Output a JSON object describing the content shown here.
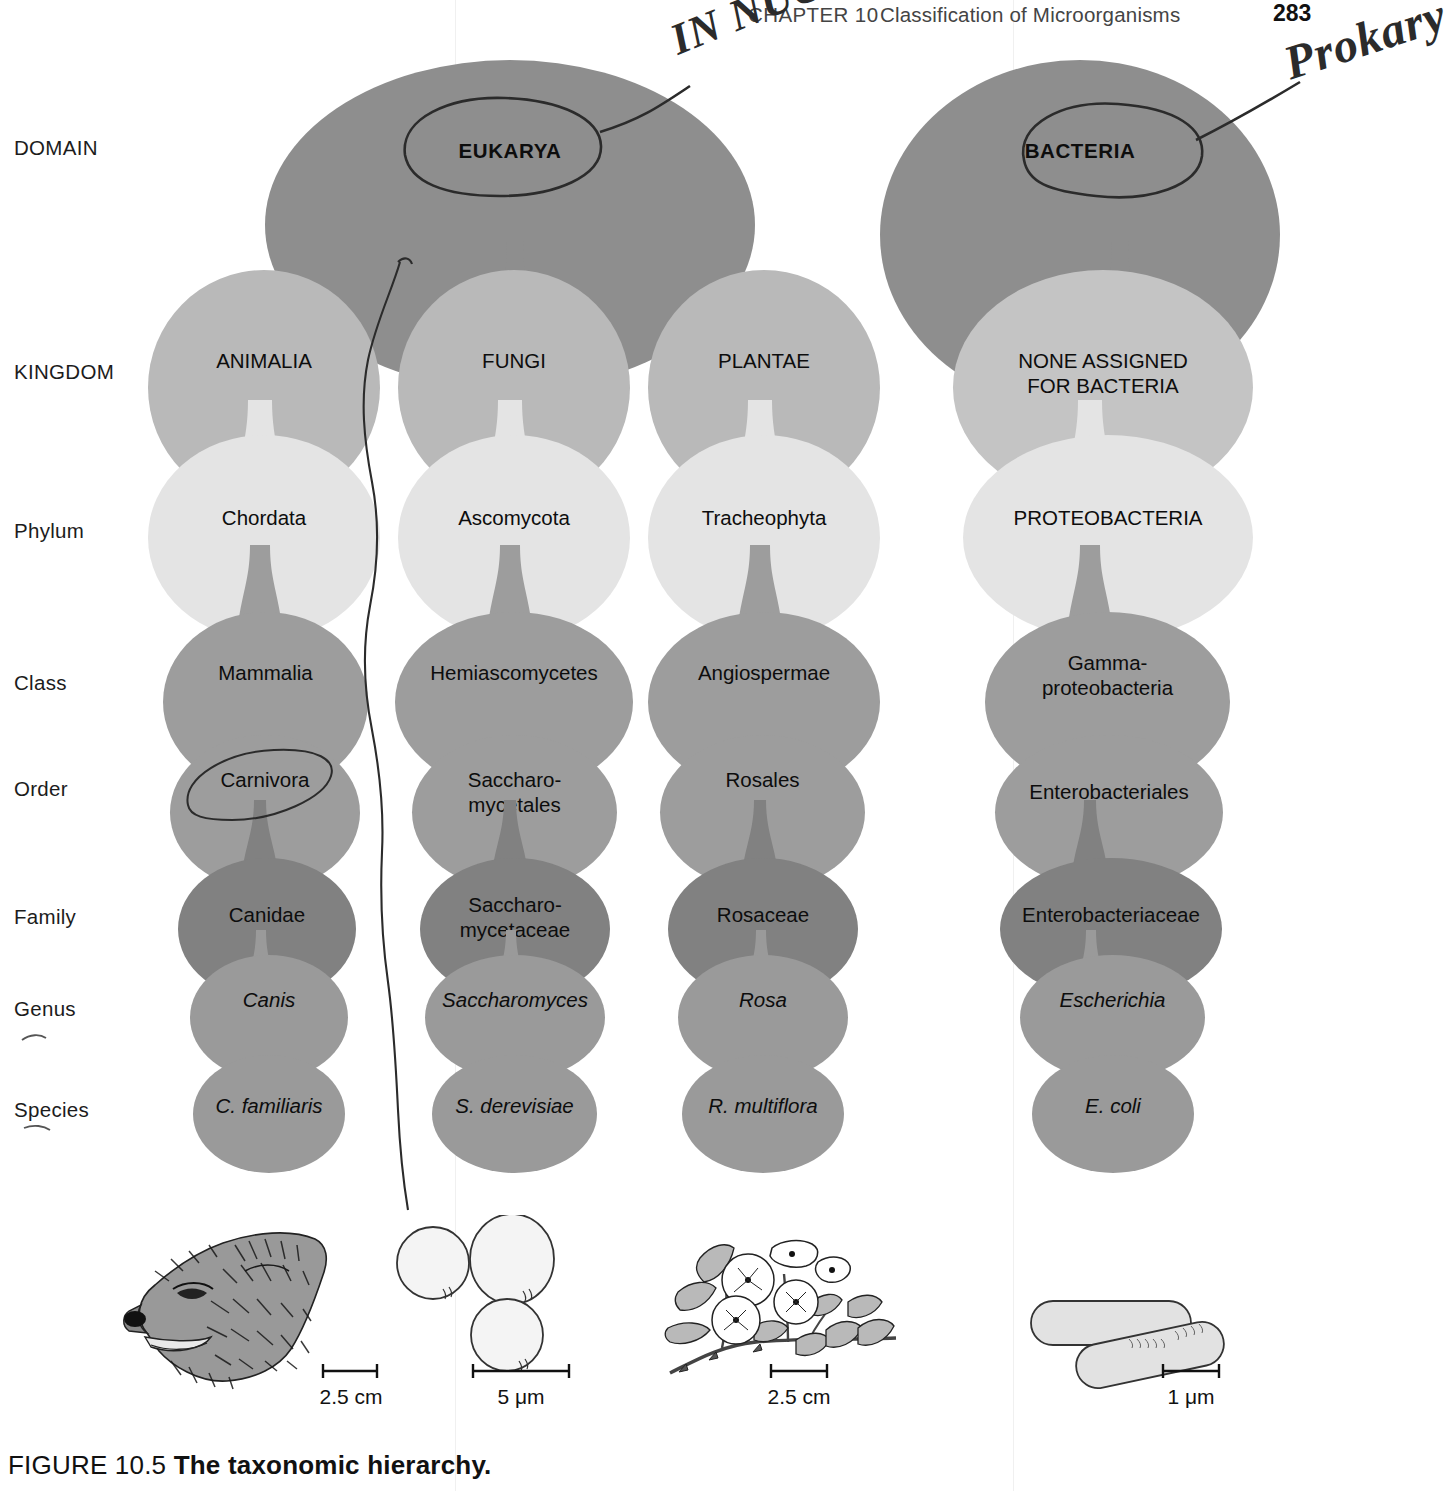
{
  "running_head": {
    "chapter": "CHAPTER 10",
    "title": "Classification of Microorganisms",
    "page_number": "283"
  },
  "ranks": [
    {
      "label": "DOMAIN",
      "y": 136
    },
    {
      "label": "KINGDOM",
      "y": 360
    },
    {
      "label": "Phylum",
      "y": 519
    },
    {
      "label": "Class",
      "y": 671
    },
    {
      "label": "Order",
      "y": 777
    },
    {
      "label": "Family",
      "y": 905
    },
    {
      "label": "Genus",
      "y": 997
    },
    {
      "label": "Species",
      "y": 1098
    }
  ],
  "columns": [
    {
      "name": "animalia-column",
      "domain": "EUKARYA",
      "kingdom": "ANIMALIA",
      "phylum": "Chordata",
      "class": "Mammalia",
      "order": "Carnivora",
      "family": "Canidae",
      "genus": "Canis",
      "species": "C. familiaris"
    },
    {
      "name": "fungi-column",
      "domain": "EUKARYA",
      "kingdom": "FUNGI",
      "phylum": "Ascomycota",
      "class": "Hemiascomycetes",
      "order": "Saccharo-\nmycetales",
      "family": "Saccharo-\nmycetaceae",
      "genus": "Saccharomyces",
      "species": "S. derevisiae"
    },
    {
      "name": "plantae-column",
      "domain": "EUKARYA",
      "kingdom": "PLANTAE",
      "phylum": "Tracheophyta",
      "class": "Angiospermae",
      "order": "Rosales",
      "family": "Rosaceae",
      "genus": "Rosa",
      "species": "R. multiflora"
    },
    {
      "name": "bacteria-column",
      "domain": "BACTERIA",
      "kingdom": "NONE ASSIGNED\nFOR BACTERIA",
      "phylum": "PROTEOBACTERIA",
      "class": "Gamma-\nproteobacteria",
      "order": "Enterobacteriales",
      "family": "Enterobacteriaceae",
      "genus": "Escherichia",
      "species": "E. coli"
    }
  ],
  "annotations": {
    "in_nucleus": "IN NUCLEUS",
    "prokaryote": "Prokary"
  },
  "organisms": [
    {
      "name": "dog-illustration",
      "scale": "2.5 cm"
    },
    {
      "name": "yeast-illustration",
      "scale": "5 μm"
    },
    {
      "name": "rose-illustration",
      "scale": "2.5 cm"
    },
    {
      "name": "ecoli-illustration",
      "scale": "1 μm"
    }
  ],
  "scale_bars": [
    {
      "value": "2.5",
      "unit": "cm"
    },
    {
      "value": "5",
      "unit": "μm"
    },
    {
      "value": "2.5",
      "unit": "cm"
    },
    {
      "value": "1",
      "unit": "μm"
    }
  ],
  "caption": {
    "prefix": "FIGURE 10.5 ",
    "bold": "The taxonomic hierarchy."
  },
  "colors": {
    "domain_fill": "#8e8e8e",
    "kingdom_fill": "#b9b9b9",
    "phylum_fill": "#e4e4e4",
    "class_fill": "#9d9d9d",
    "order_fill": "#9d9d9d",
    "family_fill": "#818181",
    "genus_fill": "#9a9a9a",
    "species_fill": "#9a9a9a",
    "ink": "#2b2b2b",
    "text": "#0d0d0d"
  }
}
